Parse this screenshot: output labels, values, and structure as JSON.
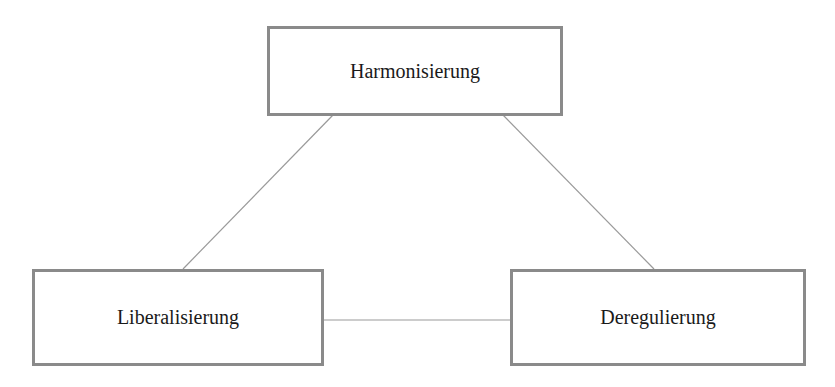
{
  "diagram": {
    "type": "triangle",
    "nodes": [
      {
        "id": "top",
        "label": "Harmonisierung",
        "x": 267,
        "y": 26,
        "w": 296,
        "h": 90
      },
      {
        "id": "left",
        "label": "Liberalisierung",
        "x": 32,
        "y": 269,
        "w": 292,
        "h": 97
      },
      {
        "id": "right",
        "label": "Deregulierung",
        "x": 510,
        "y": 269,
        "w": 296,
        "h": 97
      }
    ],
    "edges": [
      {
        "from": "top",
        "to": "left"
      },
      {
        "from": "top",
        "to": "right"
      },
      {
        "from": "left",
        "to": "right"
      }
    ],
    "colors": {
      "border": "#8a8a8a",
      "line": "#9a9a9a",
      "text": "#1a1a1a"
    }
  }
}
